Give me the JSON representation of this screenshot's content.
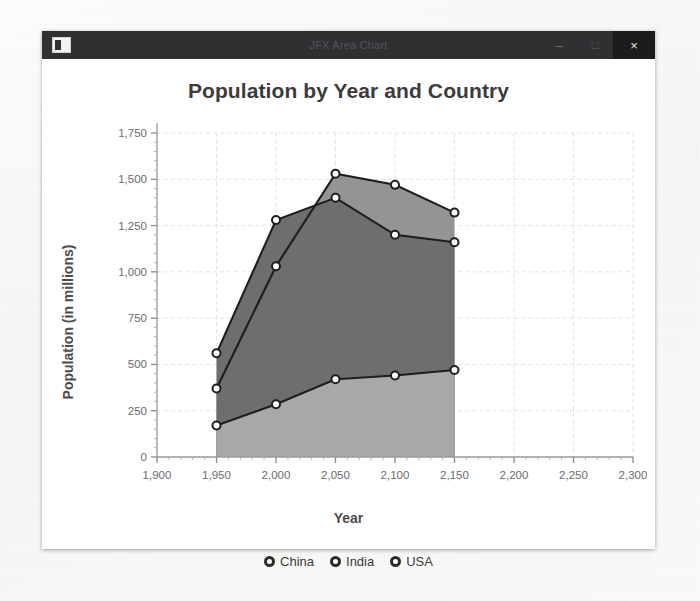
{
  "window": {
    "title": "JFX Area Chart",
    "icon": "app-window-icon",
    "controls": {
      "minimize": "–",
      "maximize": "□",
      "close": "×"
    }
  },
  "chart_data": {
    "type": "area",
    "title": "Population by Year and Country",
    "xlabel": "Year",
    "ylabel": "Population (in millions)",
    "xlim": [
      1900,
      2300
    ],
    "ylim": [
      0,
      1750
    ],
    "xticks": [
      "1,900",
      "1,950",
      "2,000",
      "2,050",
      "2,100",
      "2,150",
      "2,200",
      "2,250",
      "2,300"
    ],
    "xtick_values": [
      1900,
      1950,
      2000,
      2050,
      2100,
      2150,
      2200,
      2250,
      2300
    ],
    "yticks": [
      "0",
      "250",
      "500",
      "750",
      "1,000",
      "1,250",
      "1,500",
      "1,750"
    ],
    "ytick_values": [
      0,
      250,
      500,
      750,
      1000,
      1250,
      1500,
      1750
    ],
    "grid": true,
    "legend_position": "bottom",
    "x": [
      1950,
      2000,
      2050,
      2100,
      2150
    ],
    "series": [
      {
        "name": "China",
        "values": [
          560,
          1280,
          1400,
          1200,
          1160
        ],
        "fill": "#6e6e6e",
        "stroke": "#1e1e1e"
      },
      {
        "name": "India",
        "values": [
          370,
          1030,
          1530,
          1470,
          1320
        ],
        "fill": "#949494",
        "stroke": "#1e1e1e"
      },
      {
        "name": "USA",
        "values": [
          170,
          285,
          420,
          440,
          470
        ],
        "fill": "#a8a8a8",
        "stroke": "#1e1e1e"
      }
    ]
  },
  "legend": [
    {
      "label": "China"
    },
    {
      "label": "India"
    },
    {
      "label": "USA"
    }
  ]
}
